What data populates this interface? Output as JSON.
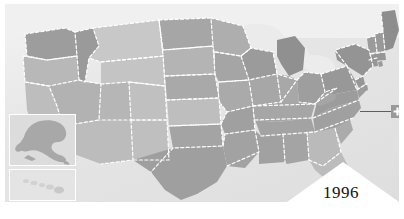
{
  "map": {
    "title": "United States choropleth map",
    "region_label": "United States",
    "background_color": "#e9e9e9",
    "ocean_color": "#e6e6e6",
    "canada_color": "#f0f0f0",
    "border_style": "dashed-white",
    "border_color": "#ffffff",
    "shade_levels": {
      "level_1": "#d6d6d6",
      "level_2": "#c9c9c9",
      "level_3": "#bdbdbd",
      "level_4": "#b0b0b0",
      "level_5": "#a3a3a3",
      "level_6": "#959595"
    },
    "states": [
      {
        "code": "WA",
        "name": "Washington",
        "shade": "#9d9d9d"
      },
      {
        "code": "OR",
        "name": "Oregon",
        "shade": "#b8b8b8"
      },
      {
        "code": "CA",
        "name": "California",
        "shade": "#bdbdbd"
      },
      {
        "code": "ID",
        "name": "Idaho",
        "shade": "#9a9a9a"
      },
      {
        "code": "NV",
        "name": "Nevada",
        "shade": "#b2b2b2"
      },
      {
        "code": "UT",
        "name": "Utah",
        "shade": "#b6b6b6"
      },
      {
        "code": "AZ",
        "name": "Arizona",
        "shade": "#bcbcbc"
      },
      {
        "code": "MT",
        "name": "Montana",
        "shade": "#c8c8c8"
      },
      {
        "code": "WY",
        "name": "Wyoming",
        "shade": "#c4c4c4"
      },
      {
        "code": "CO",
        "name": "Colorado",
        "shade": "#c0c0c0"
      },
      {
        "code": "NM",
        "name": "New Mexico",
        "shade": "#bfbfbf"
      },
      {
        "code": "ND",
        "name": "North Dakota",
        "shade": "#a6a6a6"
      },
      {
        "code": "SD",
        "name": "South Dakota",
        "shade": "#b4b4b4"
      },
      {
        "code": "NE",
        "name": "Nebraska",
        "shade": "#a9a9a9"
      },
      {
        "code": "KS",
        "name": "Kansas",
        "shade": "#bebebe"
      },
      {
        "code": "OK",
        "name": "Oklahoma",
        "shade": "#a4a4a4"
      },
      {
        "code": "TX",
        "name": "Texas",
        "shade": "#9f9f9f"
      },
      {
        "code": "MN",
        "name": "Minnesota",
        "shade": "#aeaeae"
      },
      {
        "code": "IA",
        "name": "Iowa",
        "shade": "#a5a5a5"
      },
      {
        "code": "MO",
        "name": "Missouri",
        "shade": "#aaaaaa"
      },
      {
        "code": "AR",
        "name": "Arkansas",
        "shade": "#a0a0a0"
      },
      {
        "code": "LA",
        "name": "Louisiana",
        "shade": "#a2a2a2"
      },
      {
        "code": "WI",
        "name": "Wisconsin",
        "shade": "#9b9b9b"
      },
      {
        "code": "IL",
        "name": "Illinois",
        "shade": "#a7a7a7"
      },
      {
        "code": "MI",
        "name": "Michigan",
        "shade": "#909090"
      },
      {
        "code": "IN",
        "name": "Indiana",
        "shade": "#a8a8a8"
      },
      {
        "code": "OH",
        "name": "Ohio",
        "shade": "#9e9e9e"
      },
      {
        "code": "KY",
        "name": "Kentucky",
        "shade": "#a6a6a6"
      },
      {
        "code": "TN",
        "name": "Tennessee",
        "shade": "#a3a3a3"
      },
      {
        "code": "MS",
        "name": "Mississippi",
        "shade": "#a1a1a1"
      },
      {
        "code": "AL",
        "name": "Alabama",
        "shade": "#a4a4a4"
      },
      {
        "code": "GA",
        "name": "Georgia",
        "shade": "#bababa"
      },
      {
        "code": "FL",
        "name": "Florida",
        "shade": "#bcbcbc"
      },
      {
        "code": "SC",
        "name": "South Carolina",
        "shade": "#ababab"
      },
      {
        "code": "NC",
        "name": "North Carolina",
        "shade": "#a0a0a0"
      },
      {
        "code": "VA",
        "name": "Virginia",
        "shade": "#9c9c9c"
      },
      {
        "code": "WV",
        "name": "West Virginia",
        "shade": "#a5a5a5"
      },
      {
        "code": "MD",
        "name": "Maryland",
        "shade": "#9d9d9d"
      },
      {
        "code": "DE",
        "name": "Delaware",
        "shade": "#9a9a9a"
      },
      {
        "code": "PA",
        "name": "Pennsylvania",
        "shade": "#989898"
      },
      {
        "code": "NJ",
        "name": "New Jersey",
        "shade": "#969696"
      },
      {
        "code": "NY",
        "name": "New York",
        "shade": "#949494"
      },
      {
        "code": "CT",
        "name": "Connecticut",
        "shade": "#979797"
      },
      {
        "code": "RI",
        "name": "Rhode Island",
        "shade": "#9a9a9a"
      },
      {
        "code": "MA",
        "name": "Massachusetts",
        "shade": "#959595"
      },
      {
        "code": "VT",
        "name": "Vermont",
        "shade": "#9b9b9b"
      },
      {
        "code": "NH",
        "name": "New Hampshire",
        "shade": "#999999"
      },
      {
        "code": "ME",
        "name": "Maine",
        "shade": "#8e8e8e"
      }
    ]
  },
  "insets": {
    "alaska": {
      "label": "Alaska",
      "code": "AK",
      "shade": "#a8a8a8",
      "box_color": "#dcdcdc",
      "border_color": "#ffffff"
    },
    "hawaii": {
      "label": "Hawaii",
      "code": "HI",
      "shade": "#d2d2d2",
      "box_color": "#e4e4e4",
      "border_color": "#ffffff"
    }
  },
  "callout": {
    "target_state": "Rhode Island",
    "target_code": "RI",
    "icon": "plus-marker-icon",
    "marker_color": "#9a9a9a",
    "symbol_color": "#ffffff",
    "line_color": "#5f5f5f"
  },
  "banner": {
    "year": "1996",
    "shape": "triangle",
    "fill_color": "#ffffff",
    "text_color": "#111111"
  }
}
